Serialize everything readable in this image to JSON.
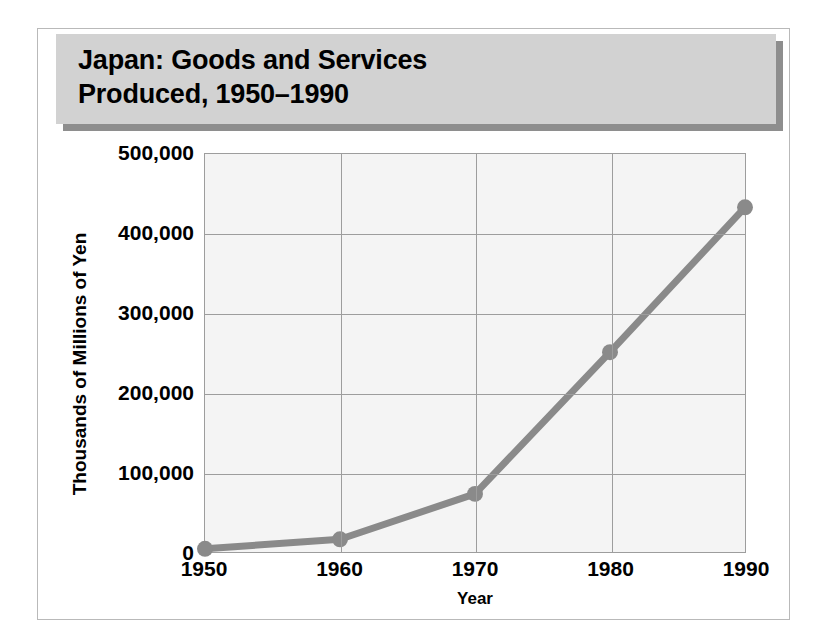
{
  "figure": {
    "title": "Japan:  Goods and Services\nProduced, 1950–1990",
    "border_color": "#b9b9b9",
    "title_bar_color": "#d2d2d2",
    "title_shadow_color": "#8e8e8e"
  },
  "chart_data": {
    "type": "line",
    "title": "Japan:  Goods and Services Produced, 1950–1990",
    "xlabel": "Year",
    "ylabel": "Thousands of Millions of Yen",
    "x": [
      1950,
      1960,
      1970,
      1980,
      1990
    ],
    "categories": [
      "1950",
      "1960",
      "1970",
      "1980",
      "1990"
    ],
    "values": [
      4000,
      16000,
      73000,
      251000,
      433000
    ],
    "series": [
      {
        "name": "Goods and Services Produced",
        "values": [
          4000,
          16000,
          73000,
          251000,
          433000
        ]
      }
    ],
    "xlim": [
      1950,
      1990
    ],
    "ylim": [
      0,
      500000
    ],
    "ytick_values": [
      0,
      100000,
      200000,
      300000,
      400000,
      500000
    ],
    "ytick_labels": [
      "0",
      "100,000",
      "200,000",
      "300,000",
      "400,000",
      "500,000"
    ],
    "xtick_labels": [
      "1950",
      "1960",
      "1970",
      "1980",
      "1990"
    ],
    "grid": true,
    "legend": false,
    "line_color": "#8a8a8a",
    "marker_color": "#8a8a8a",
    "plot_background": "#f4f4f4",
    "grid_color": "#9d9d9d"
  }
}
